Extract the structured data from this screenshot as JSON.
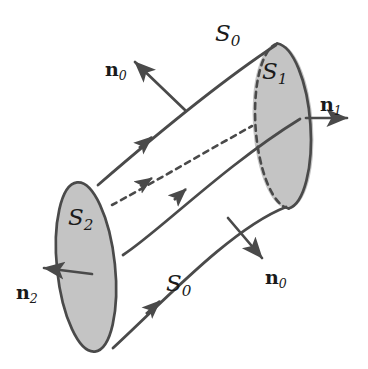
{
  "figure": {
    "colors": {
      "stroke": "#4a4a4a",
      "fill": "#c4c4c4",
      "background": "#ffffff",
      "text": "#1a1a1a"
    },
    "surfaces": [
      {
        "id": "S1",
        "name": "right-cross-section",
        "letter": "S",
        "subscript": "1",
        "fill": "#c4c4c4",
        "edge_back": "dashed",
        "edge_front": "solid"
      },
      {
        "id": "S2",
        "name": "left-cross-section",
        "letter": "S",
        "subscript": "2",
        "fill": "#c4c4c4",
        "edge_back": "solid",
        "edge_front": "solid"
      },
      {
        "id": "S0_top",
        "name": "lateral-surface-top",
        "letter": "S",
        "subscript": "0"
      },
      {
        "id": "S0_bottom",
        "name": "lateral-surface-bottom",
        "letter": "S",
        "subscript": "0"
      }
    ],
    "normals": [
      {
        "id": "n0_top",
        "name": "normal-lateral-top",
        "letter": "n",
        "subscript": "0",
        "direction": "up-left"
      },
      {
        "id": "n0_bottom",
        "name": "normal-lateral-bottom",
        "letter": "n",
        "subscript": "0",
        "direction": "down-right"
      },
      {
        "id": "n1",
        "name": "normal-right-cross-section",
        "letter": "n",
        "subscript": "1",
        "direction": "right"
      },
      {
        "id": "n2",
        "name": "normal-left-cross-section",
        "letter": "n",
        "subscript": "2",
        "direction": "left"
      }
    ],
    "field_lines": [
      {
        "id": "line_top",
        "name": "top-boundary-streamline",
        "style": "solid",
        "arrow": true
      },
      {
        "id": "line_middle",
        "name": "middle-streamline",
        "style": "solid",
        "arrow": true
      },
      {
        "id": "line_hidden",
        "name": "hidden-interior-streamline",
        "style": "dashed",
        "arrow": true
      },
      {
        "id": "line_bottom",
        "name": "bottom-boundary-streamline",
        "style": "solid",
        "arrow": true
      }
    ],
    "labels": {
      "s0_top": {
        "letter": "S",
        "subscript": "0",
        "x": 215,
        "y": 22,
        "size": 23
      },
      "s0_bottom": {
        "letter": "S",
        "subscript": "0",
        "x": 166,
        "y": 272,
        "size": 23
      },
      "s1": {
        "letter": "S",
        "subscript": "1",
        "x": 262,
        "y": 60,
        "size": 23
      },
      "s2": {
        "letter": "S",
        "subscript": "2",
        "x": 68,
        "y": 206,
        "size": 23
      },
      "n0_top": {
        "letter": "n",
        "subscript": "0",
        "x": 105,
        "y": 60,
        "size": 19
      },
      "n0_bottom": {
        "letter": "n",
        "subscript": "0",
        "x": 265,
        "y": 268,
        "size": 19
      },
      "n1": {
        "letter": "n",
        "subscript": "1",
        "x": 320,
        "y": 95,
        "size": 19
      },
      "n2": {
        "letter": "n",
        "subscript": "2",
        "x": 16,
        "y": 283,
        "size": 19
      }
    }
  }
}
